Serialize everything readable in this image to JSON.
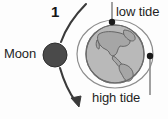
{
  "diagram": {
    "step_number": "1",
    "moon_label": "Moon",
    "low_tide_label": "low tide",
    "high_tide_label": "high tide",
    "colors": {
      "background": "#fdfdfd",
      "moon_fill": "#4a4a4a",
      "moon_stroke": "#2f2f2f",
      "earth_ocean": "#b9b9b9",
      "earth_land": "#9a9a9a",
      "earth_stroke": "#6a6a6a",
      "bulge_ellipse_stroke": "#8d8d8d",
      "marker_dot": "#1a1a1a",
      "leader_line": "#8a8a8a",
      "arrow": "#3a3a3a",
      "text": "#1f1f1f"
    },
    "elements": {
      "moon": {
        "cx": 55,
        "cy": 55,
        "r": 12
      },
      "earth": {
        "cx": 115,
        "cy": 54,
        "r": 29
      },
      "tidal_bulge_ellipse": {
        "cx": 115,
        "cy": 54,
        "rx": 38,
        "ry": 34
      },
      "low_tide_marker_dot": {
        "cx": 112,
        "cy": 22,
        "r": 3
      },
      "high_tide_marker_dot": {
        "cx": 150,
        "cy": 56,
        "r": 3
      },
      "low_tide_leader_line": {
        "x": 112,
        "y1": 2,
        "y2": 22
      },
      "high_tide_leader_line": {
        "x": 150,
        "y1": 56,
        "y2": 95
      },
      "orbit_arrow": {
        "from": [
          85,
          5
        ],
        "to": [
          78,
          106
        ]
      }
    }
  }
}
